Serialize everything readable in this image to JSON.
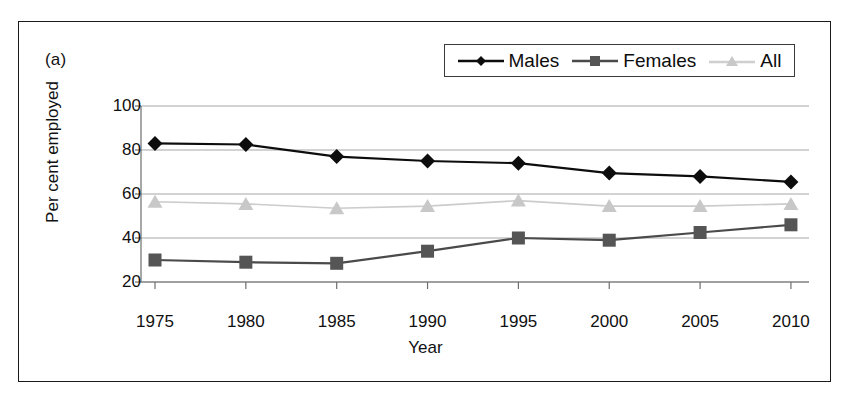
{
  "panel": {
    "label": "(a)"
  },
  "legend": {
    "position": "top-right",
    "entries": [
      {
        "name": "Males",
        "marker": "diamond",
        "color": "#0d0d0d"
      },
      {
        "name": "Females",
        "marker": "square",
        "color": "#555555"
      },
      {
        "name": "All",
        "marker": "triangle",
        "color": "#c8c8c8"
      }
    ]
  },
  "chart_data": {
    "type": "line",
    "title": "",
    "subtitle": "",
    "xlabel": "Year",
    "ylabel": "Per cent employed",
    "categories": [
      "1975",
      "1980",
      "1985",
      "1990",
      "1995",
      "2000",
      "2005",
      "2010"
    ],
    "x": [
      1975,
      1980,
      1985,
      1990,
      1995,
      2000,
      2005,
      2010
    ],
    "xlim": [
      1972.5,
      2012.5
    ],
    "ylim": [
      20,
      100
    ],
    "yticks": [
      20,
      40,
      60,
      80,
      100
    ],
    "xticks": [
      1975,
      1980,
      1985,
      1990,
      1995,
      2000,
      2005,
      2010
    ],
    "grid": "horizontal",
    "legend_position": "top-right",
    "annotations": [
      "(a)"
    ],
    "series": [
      {
        "name": "Males",
        "marker": "diamond",
        "color": "#0d0d0d",
        "line_color": "#0d0d0d",
        "values": [
          83,
          82.5,
          77,
          75,
          74,
          69.5,
          68,
          65.5
        ]
      },
      {
        "name": "Females",
        "marker": "square",
        "color": "#555555",
        "line_color": "#4a4a4a",
        "values": [
          30,
          29,
          28.5,
          34,
          40,
          39,
          42.5,
          46
        ]
      },
      {
        "name": "All",
        "marker": "triangle",
        "color": "#c8c8c8",
        "line_color": "#cccccc",
        "values": [
          56.5,
          55.5,
          53.5,
          54.5,
          57,
          54.5,
          54.5,
          55.5
        ]
      }
    ]
  },
  "colors": {
    "frame": "#1a1a1a",
    "gridline": "#a6a6a6",
    "axis": "#6e6e6e",
    "background": "#ffffff",
    "text": "#111111"
  }
}
